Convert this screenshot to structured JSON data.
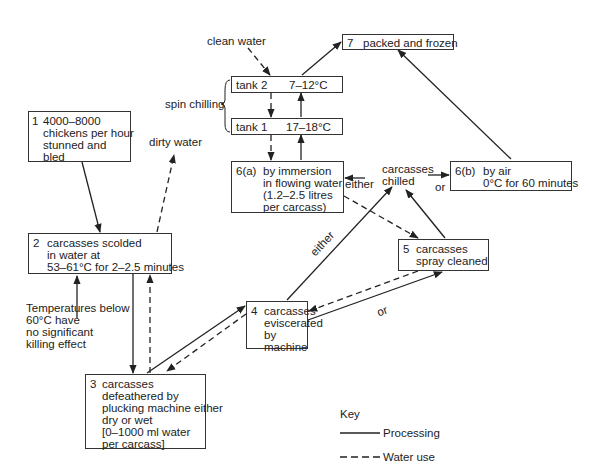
{
  "diagram": {
    "title": "",
    "nodes": {
      "n1": {
        "num": "1",
        "text": "4000–8000\nchickens per hour\nstunned and\nbled"
      },
      "n2": {
        "num": "2",
        "text": "carcasses scolded\nin water at\n53–61°C for 2–2.5 minutes"
      },
      "n3": {
        "num": "3",
        "text": "carcasses\ndefeathered by\nplucking machine either\ndry or wet\n[0–1000 ml water\nper carcass]"
      },
      "n4": {
        "num": "4",
        "text": "carcasses\neviscerated\nby\nmachine"
      },
      "n5": {
        "num": "5",
        "text": "carcasses\nspray cleaned"
      },
      "n6a": {
        "num": "6(a)",
        "text": "by immersion\nin flowing water\n(1.2–2.5 litres\nper carcass)"
      },
      "n6b": {
        "num": "6(b)",
        "text": "by air\n0°C for 60 minutes"
      },
      "n7": {
        "num": "7",
        "text": "packed and frozen"
      },
      "tank2": {
        "name": "tank 2",
        "temp": "7–12°C"
      },
      "tank1": {
        "name": "tank 1",
        "temp": "17–18°C"
      }
    },
    "labels": {
      "clean_water": "clean water",
      "dirty_water": "dirty water",
      "spin_chilling": "spin chilling",
      "carcasses_chilled": "carcasses\nchilled",
      "either_6a": "either",
      "or_6b": "or",
      "either_diag": "either",
      "or_diag": "or",
      "temp_note": "Temperatures below\n60°C have\nno significant\nkilling effect"
    },
    "key": {
      "title": "Key",
      "items": [
        {
          "style": "solid",
          "label": "Processing"
        },
        {
          "style": "dashed",
          "label": "Water use"
        }
      ]
    },
    "colors": {
      "line": "#222222",
      "text": "#222222",
      "background": "#ffffff"
    }
  }
}
